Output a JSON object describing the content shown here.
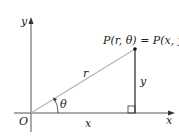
{
  "diagram": {
    "point_label": "P(r, θ) = P(x, y)",
    "origin_label": "O",
    "x_axis_label": "x",
    "y_axis_label": "y",
    "hypotenuse_label": "r",
    "angle_label": "θ",
    "horizontal_leg_label": "x",
    "vertical_leg_label": "y",
    "colors": {
      "axis": "#555555",
      "radius": "#b5b5b5",
      "leg": "#222222",
      "point": "#111111"
    }
  }
}
